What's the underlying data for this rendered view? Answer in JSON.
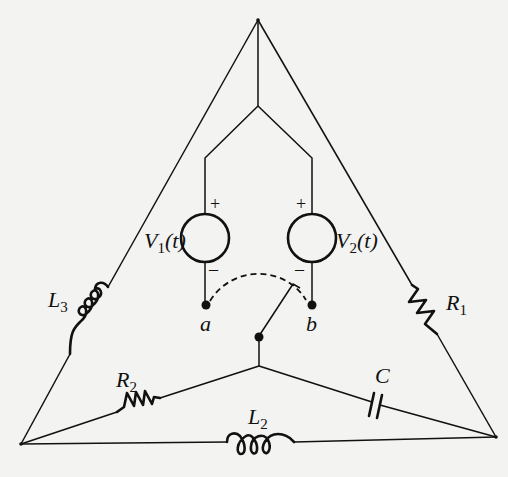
{
  "diagram": {
    "type": "circuit-schematic",
    "colors": {
      "ink": "#111111",
      "paper": "#f3f3f1"
    },
    "sources": [
      {
        "id": "V1",
        "label": "V",
        "subscript": "1",
        "arg": "(t)",
        "plus": "+",
        "minus": "–"
      },
      {
        "id": "V2",
        "label": "V",
        "subscript": "2",
        "arg": "(t)",
        "plus": "+",
        "minus": "–"
      }
    ],
    "terminals": [
      {
        "id": "a",
        "label": "a"
      },
      {
        "id": "b",
        "label": "b"
      }
    ],
    "components": [
      {
        "id": "L3",
        "type": "inductor",
        "label": "L",
        "subscript": "3"
      },
      {
        "id": "R1",
        "type": "resistor",
        "label": "R",
        "subscript": "1"
      },
      {
        "id": "R2",
        "type": "resistor",
        "label": "R",
        "subscript": "2"
      },
      {
        "id": "C",
        "type": "capacitor",
        "label": "C",
        "subscript": ""
      },
      {
        "id": "L2",
        "type": "inductor",
        "label": "L",
        "subscript": "2"
      }
    ],
    "switch": {
      "type": "SPDT",
      "positions": [
        "a",
        "b"
      ],
      "pivot": "center-node"
    }
  }
}
